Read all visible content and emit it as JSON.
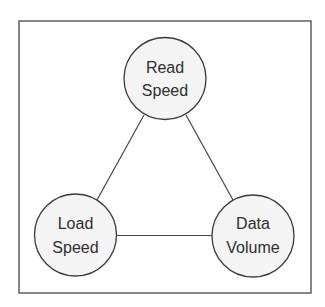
{
  "diagram": {
    "type": "triangle-tradeoff",
    "nodes": [
      {
        "id": "read_speed",
        "lines": [
          "Read",
          "Speed"
        ]
      },
      {
        "id": "load_speed",
        "lines": [
          "Load",
          "Speed"
        ]
      },
      {
        "id": "data_volume",
        "lines": [
          "Data",
          "Volume"
        ]
      }
    ],
    "edges": [
      {
        "from": "read_speed",
        "to": "load_speed"
      },
      {
        "from": "read_speed",
        "to": "data_volume"
      },
      {
        "from": "load_speed",
        "to": "data_volume"
      }
    ]
  }
}
